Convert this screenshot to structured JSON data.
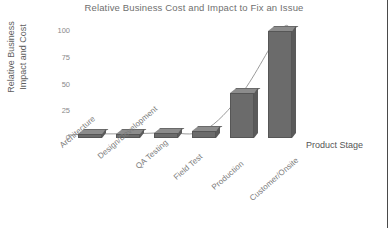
{
  "chart_data": {
    "type": "bar",
    "title": "Relative Business Cost and Impact to Fix an Issue",
    "xlabel": "Product Stage",
    "ylabel": "Relative Business Impact and Cost",
    "ylabel_line1": "Relative Business",
    "ylabel_line2": "Impact and Cost",
    "categories": [
      "Architecture",
      "Design/Development",
      "QA Testing",
      "Field Test",
      "Production",
      "Customer/Onsite"
    ],
    "values": [
      3,
      4,
      5,
      7,
      42,
      100
    ],
    "yticks": [
      0,
      25,
      50,
      75,
      100
    ],
    "ytick_labels": [
      "0",
      "25",
      "50",
      "75",
      "100"
    ],
    "ylim": [
      0,
      105
    ],
    "grid": false,
    "legend": "none",
    "series": [
      {
        "name": "Relative Business Impact and Cost",
        "values": [
          3,
          4,
          5,
          7,
          42,
          100
        ]
      }
    ],
    "overlay": {
      "type": "line",
      "name": "trend-curve",
      "description": "smooth exponential curve through bar tops",
      "values": [
        3,
        4,
        5,
        7,
        42,
        100
      ]
    },
    "colors": {
      "bar_front": "#6b6b6b",
      "bar_top": "#8c8c8c",
      "bar_side": "#5a5a5a",
      "curve": "#8f8f8f",
      "title_text": "#6f6f6f",
      "tick_text": "#8a8a8a",
      "axis_label_text": "#5e5e5e",
      "background": "#ffffff"
    }
  }
}
